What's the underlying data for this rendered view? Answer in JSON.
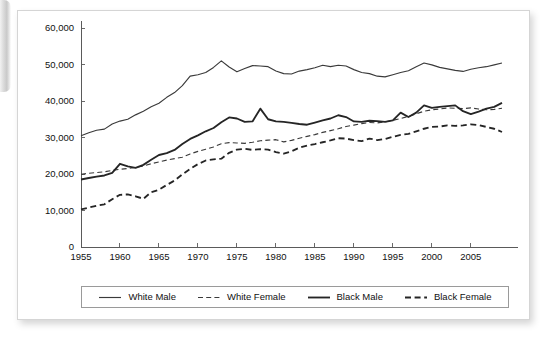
{
  "figure": {
    "background_color": "#ffffff",
    "border_color": "#d5d5d5"
  },
  "chart_data": {
    "type": "line",
    "title": "",
    "subtitle": "",
    "xlabel": "",
    "ylabel": "",
    "xlim": [
      1955,
      2009
    ],
    "ylim": [
      0,
      60000
    ],
    "grid": false,
    "legend_position": "bottom",
    "y_ticks": [
      0,
      10000,
      20000,
      30000,
      40000,
      50000,
      60000
    ],
    "y_tick_labels": [
      "0",
      "10,000",
      "20,000",
      "30,000",
      "40,000",
      "50,000",
      "60,000"
    ],
    "x_ticks": [
      1955,
      1960,
      1965,
      1970,
      1975,
      1980,
      1985,
      1990,
      1995,
      2000,
      2005
    ],
    "x_tick_labels": [
      "1955",
      "1960",
      "1965",
      "1970",
      "1975",
      "1980",
      "1985",
      "1990",
      "1995",
      "2000",
      "2005"
    ],
    "x": [
      1955,
      1956,
      1957,
      1958,
      1959,
      1960,
      1961,
      1962,
      1963,
      1964,
      1965,
      1966,
      1967,
      1968,
      1969,
      1970,
      1971,
      1972,
      1973,
      1974,
      1975,
      1976,
      1977,
      1978,
      1979,
      1980,
      1981,
      1982,
      1983,
      1984,
      1985,
      1986,
      1987,
      1988,
      1989,
      1990,
      1991,
      1992,
      1993,
      1994,
      1995,
      1996,
      1997,
      1998,
      1999,
      2000,
      2001,
      2002,
      2003,
      2004,
      2005,
      2006,
      2007,
      2008,
      2009
    ],
    "series": [
      {
        "name": "White Male",
        "style": "solid",
        "weight": "thin",
        "color": "#3a3a3a",
        "values": [
          30500,
          31300,
          32000,
          32300,
          33700,
          34500,
          35000,
          36200,
          37200,
          38400,
          39400,
          41000,
          42300,
          44200,
          46800,
          47200,
          47800,
          49200,
          51000,
          49300,
          48000,
          48900,
          49700,
          49600,
          49400,
          48200,
          47500,
          47400,
          48200,
          48600,
          49100,
          49800,
          49400,
          49800,
          49600,
          48600,
          47800,
          47500,
          46800,
          46600,
          47200,
          47800,
          48300,
          49400,
          50400,
          49900,
          49200,
          48800,
          48400,
          48100,
          48700,
          49100,
          49400,
          49900,
          50400
        ]
      },
      {
        "name": "White Female",
        "style": "dashed",
        "weight": "thin",
        "color": "#3a3a3a",
        "values": [
          19900,
          20200,
          20400,
          20600,
          21000,
          21300,
          21500,
          21800,
          22200,
          22800,
          23300,
          23800,
          24200,
          24600,
          25500,
          26200,
          26800,
          27400,
          28300,
          28600,
          28500,
          28400,
          28700,
          29100,
          29300,
          29400,
          28800,
          29200,
          29800,
          30300,
          30800,
          31400,
          31900,
          32400,
          33000,
          33400,
          33800,
          34100,
          34000,
          34300,
          34700,
          35200,
          35800,
          36500,
          37200,
          37600,
          37800,
          38100,
          38000,
          37900,
          38100,
          37800,
          37600,
          37700,
          38000
        ]
      },
      {
        "name": "Black Male",
        "style": "solid",
        "weight": "thick",
        "color": "#252525",
        "values": [
          18500,
          18900,
          19300,
          19600,
          20300,
          22800,
          22100,
          21700,
          22500,
          23900,
          25200,
          25700,
          26600,
          28200,
          29600,
          30600,
          31700,
          32600,
          34200,
          35500,
          35200,
          34300,
          34400,
          37900,
          35000,
          34400,
          34300,
          34000,
          33700,
          33500,
          34100,
          34700,
          35200,
          36100,
          35600,
          34400,
          34300,
          34600,
          34500,
          34300,
          34700,
          36800,
          35600,
          36800,
          38800,
          38100,
          38400,
          38600,
          38800,
          37200,
          36400,
          37100,
          37900,
          38400,
          39500
        ]
      },
      {
        "name": "Black Female",
        "style": "dashed",
        "weight": "thick",
        "color": "#252525",
        "values": [
          10300,
          10800,
          11300,
          11700,
          13100,
          14300,
          14400,
          13900,
          13200,
          15000,
          15700,
          17000,
          18200,
          19900,
          21400,
          22700,
          23700,
          24000,
          24200,
          25800,
          26700,
          26900,
          26600,
          26800,
          26700,
          26000,
          25600,
          26200,
          27200,
          27800,
          28200,
          28700,
          29200,
          29800,
          29700,
          29300,
          29000,
          29700,
          29300,
          29600,
          30200,
          30700,
          31000,
          31700,
          32400,
          32900,
          33000,
          33300,
          33200,
          33300,
          33600,
          33400,
          32900,
          32400,
          31500
        ]
      }
    ]
  },
  "legend": {
    "entries": [
      {
        "label": "White Male",
        "style": "solid",
        "weight": "thin"
      },
      {
        "label": "White Female",
        "style": "dashed",
        "weight": "thin"
      },
      {
        "label": "Black Male",
        "style": "solid",
        "weight": "thick"
      },
      {
        "label": "Black Female",
        "style": "dashed",
        "weight": "thick"
      }
    ]
  }
}
